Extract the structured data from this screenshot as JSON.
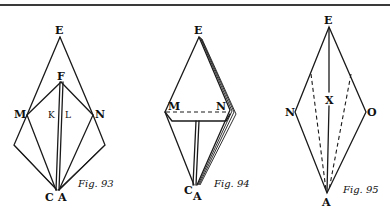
{
  "page": {
    "background": "#ffffff",
    "ink": "#1a1a1a"
  },
  "figures": [
    {
      "id": "fig93",
      "caption": "Fig. 93",
      "labels": {
        "E": "E",
        "F": "F",
        "M": "M",
        "N": "N",
        "K": "K",
        "L": "L",
        "C": "C",
        "A": "A"
      }
    },
    {
      "id": "fig94",
      "caption": "Fig. 94",
      "labels": {
        "E": "E",
        "M": "M",
        "N": "N",
        "C": "C",
        "A": "A"
      }
    },
    {
      "id": "fig95",
      "caption": "Fig. 95",
      "labels": {
        "E": "E",
        "N": "N",
        "O": "O",
        "X": "X",
        "A": "A"
      }
    }
  ]
}
